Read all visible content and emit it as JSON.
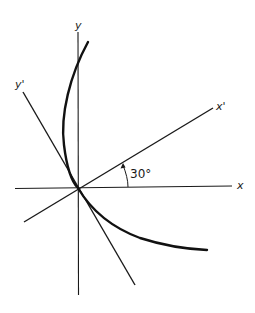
{
  "figure": {
    "type": "coordinate-rotation diagram",
    "labels": {
      "x_axis": "x",
      "y_axis": "y",
      "x_prime_axis": "x'",
      "y_prime_axis": "y'",
      "rotation_angle": "30°"
    },
    "rotation_angle_degrees": 30,
    "elements": [
      "original x axis (horizontal)",
      "original y axis (vertical)",
      "rotated x' axis (30° counter-clockwise from x)",
      "rotated y' axis (perpendicular to x')",
      "bold curve (parabola-like) tangent to y' axis at origin",
      "curved arrow indicating 30° angle between x and x'"
    ]
  }
}
